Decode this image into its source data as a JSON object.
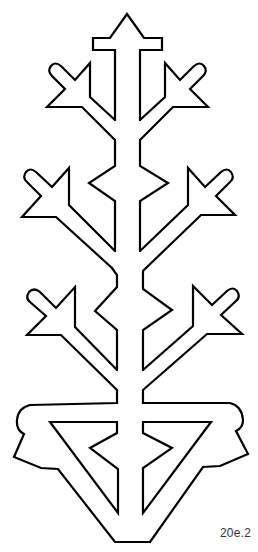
{
  "figure": {
    "stroke_color": "#000000",
    "background_color": "#ffffff"
  },
  "label": {
    "text": "20e.2"
  }
}
